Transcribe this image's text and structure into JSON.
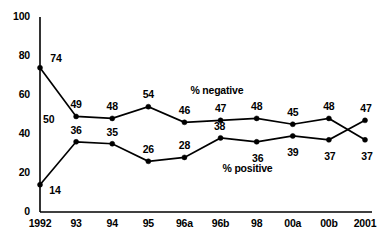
{
  "chart_data": {
    "type": "line",
    "title": "",
    "xlabel": "",
    "ylabel": "",
    "ylim": [
      0,
      100
    ],
    "yticks": [
      0,
      20,
      40,
      60,
      80,
      100
    ],
    "ytick_labels": [
      "0",
      "20",
      "40",
      "60",
      "80",
      "100"
    ],
    "grid": false,
    "legend_position": "inline-annotation",
    "categories": [
      "1992",
      "93",
      "94",
      "95",
      "96a",
      "96b",
      "98",
      "00a",
      "00b",
      "2001"
    ],
    "series": [
      {
        "name": "% negative",
        "values": [
          74,
          49,
          48,
          54,
          46,
          47,
          48,
          45,
          48,
          37
        ],
        "point_labels": [
          "74",
          "49",
          "48",
          "54",
          "46",
          "47",
          "48",
          "45",
          "48",
          "37"
        ],
        "annotation": "% negative"
      },
      {
        "name": "% positive",
        "values": [
          14,
          36,
          35,
          26,
          28,
          38,
          36,
          39,
          37,
          47
        ],
        "point_labels": [
          "14",
          "36",
          "35",
          "26",
          "28",
          "38",
          "36",
          "39",
          "37",
          "47"
        ],
        "annotation": "% positive"
      }
    ],
    "extra_annotations": [
      {
        "text": "50",
        "note": "axis-adjacent value label at 1992"
      }
    ],
    "colors": {
      "line": "#000000",
      "marker": "#000000",
      "axis": "#000000",
      "background": "#ffffff"
    }
  }
}
